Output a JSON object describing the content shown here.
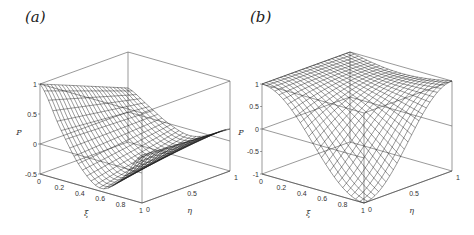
{
  "panels": [
    {
      "label": "(a)"
    },
    {
      "label": "(b)"
    }
  ],
  "chart_data": [
    {
      "type": "surface",
      "title": "(a)",
      "xlabel": "ξ",
      "ylabel": "η",
      "zlabel": "P",
      "xlim": [
        0,
        1
      ],
      "ylim": [
        0,
        1
      ],
      "zlim": [
        -0.5,
        1
      ],
      "xticks": [
        "0",
        "0.2",
        "0.4",
        "0.6",
        "0.8",
        "1"
      ],
      "yticks": [
        "0",
        "0.5",
        "1"
      ],
      "zticks": [
        "-0.5",
        "0",
        "0.5",
        "1"
      ],
      "grid": false,
      "box": true,
      "description": "Wireframe mesh surface: P=1 at ξ=0, dips to a minimum near ξ≈0.6 (~-0.5), rises again toward ξ=1; amplitude decreases with η",
      "projection": {
        "origin": [
          40,
          174
        ],
        "ex": [
          102,
          29
        ],
        "ey": [
          88,
          -32
        ],
        "ez": 60
      },
      "surface_samples": {
        "xi": [
          0,
          0.2,
          0.4,
          0.6,
          0.8,
          1
        ],
        "eta0": [
          1.0,
          0.35,
          -0.2,
          -0.45,
          -0.2,
          0.3
        ],
        "eta1": [
          0.4,
          0.2,
          0.0,
          -0.1,
          0.0,
          0.2
        ]
      }
    },
    {
      "type": "surface",
      "title": "(b)",
      "xlabel": "ξ",
      "ylabel": "η",
      "zlabel": "P",
      "xlim": [
        0,
        1
      ],
      "ylim": [
        0,
        1
      ],
      "zlim": [
        -1,
        1
      ],
      "xticks": [
        "0",
        "0.2",
        "0.4",
        "0.6",
        "0.8",
        "1"
      ],
      "yticks": [
        "0",
        "0.5",
        "1"
      ],
      "zticks": [
        "-1",
        "-0.5",
        "0",
        "0.5",
        "1"
      ],
      "grid": false,
      "box": true,
      "description": "Wireframe mesh surface: P=1 at ξ=0, falls to -1 at ξ=1 for η=0, saddle-like trough rising to peak 1 along η=1",
      "projection": {
        "origin": [
          262,
          174
        ],
        "ex": [
          102,
          29
        ],
        "ey": [
          88,
          -32
        ],
        "ez": 45
      },
      "surface_samples": {
        "xi": [
          0,
          0.2,
          0.4,
          0.6,
          0.8,
          1
        ],
        "eta0": [
          1.0,
          0.81,
          0.31,
          -0.31,
          -0.81,
          -1.0
        ],
        "eta1": [
          1.0,
          1.0,
          1.0,
          1.0,
          1.0,
          1.0
        ]
      }
    }
  ]
}
